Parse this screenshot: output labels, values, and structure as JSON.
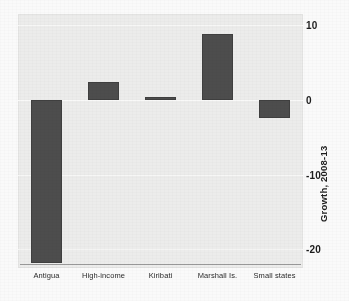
{
  "chart_data": {
    "type": "bar",
    "title": "",
    "subtitle": "",
    "xlabel": "",
    "ylabel": "Growth, 2008-13",
    "categories": [
      "Antigua",
      "High-income",
      "Kiribati",
      "Marshall Is.",
      "Small states"
    ],
    "values": [
      -21.8,
      2.4,
      0.4,
      8.8,
      -2.4
    ],
    "series": [
      {
        "name": "Growth, 2008-13",
        "values": [
          -21.8,
          2.4,
          0.4,
          8.8,
          -2.4
        ]
      }
    ],
    "ylim": [
      -22.5,
      11.5
    ],
    "yticks": [
      10,
      0,
      -10,
      -20
    ],
    "ytick_labels": [
      "10",
      "0",
      "-10",
      "-20"
    ],
    "y_axis_position": "right",
    "grid": true,
    "grid_orientation": "horizontal",
    "legend": false,
    "legend_position": "none",
    "bar_color": "#4d4d4d",
    "panel_background": "#ececeb",
    "figure_background": "#fafafa",
    "gridline_color": "#f7f7f6",
    "baseline_color": "#9a9a9a",
    "text_color": "#1d1d1d"
  },
  "axis": {
    "ticks": [
      {
        "label": "10",
        "value": 10
      },
      {
        "label": "0",
        "value": 0
      },
      {
        "label": "-10",
        "value": -10
      },
      {
        "label": "-20",
        "value": -20
      }
    ],
    "title": "Growth, 2008-13"
  },
  "bars": [
    {
      "label": "Antigua",
      "value": -21.8
    },
    {
      "label": "High-income",
      "value": 2.4
    },
    {
      "label": "Kiribati",
      "value": 0.4
    },
    {
      "label": "Marshall Is.",
      "value": 8.8
    },
    {
      "label": "Small states",
      "value": -2.4
    }
  ]
}
